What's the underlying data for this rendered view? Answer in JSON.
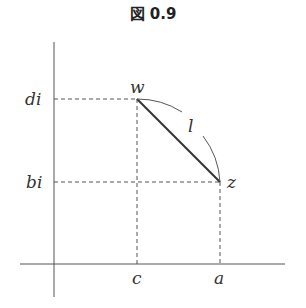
{
  "figure": {
    "title": "図 0.9",
    "labels": {
      "w": "w",
      "z": "z",
      "l": "l",
      "di": "di",
      "bi": "bi",
      "c": "c",
      "a": "a"
    },
    "points": {
      "w": {
        "x": "c",
        "y": "di"
      },
      "z": {
        "x": "a",
        "y": "bi"
      }
    }
  }
}
